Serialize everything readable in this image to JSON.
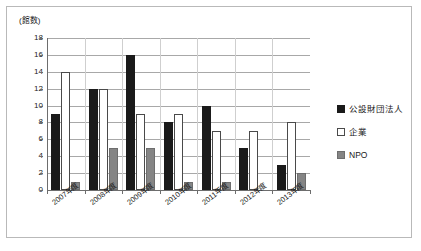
{
  "chart_data": {
    "type": "bar",
    "title": "",
    "subtitle": "",
    "xlabel": "",
    "ylabel": "(館数)",
    "ylim": [
      0,
      18
    ],
    "ytick_step": 2,
    "yticks": [
      "18",
      "16",
      "14",
      "12",
      "10",
      "8",
      "6",
      "4",
      "2",
      "0"
    ],
    "grid": true,
    "legend_position": "right",
    "categories": [
      "2007年度",
      "2008年度",
      "2009年度",
      "2010年度",
      "2011年度",
      "2012年度",
      "2013年度"
    ],
    "series": [
      {
        "name": "公設財団法人",
        "color": "#1a1a1a",
        "values": [
          9,
          12,
          16,
          8,
          10,
          5,
          3
        ]
      },
      {
        "name": "企業",
        "color": "#ffffff",
        "values": [
          14,
          12,
          9,
          9,
          7,
          7,
          8
        ]
      },
      {
        "name": "NPO",
        "color": "#858585",
        "values": [
          1,
          5,
          5,
          1,
          1,
          0,
          2
        ]
      }
    ]
  },
  "legend": {
    "items": [
      {
        "label": "公設財団法人",
        "swatch": "black-square-icon"
      },
      {
        "label": "企業",
        "swatch": "white-square-icon"
      },
      {
        "label": "NPO",
        "swatch": "gray-square-icon"
      }
    ]
  }
}
